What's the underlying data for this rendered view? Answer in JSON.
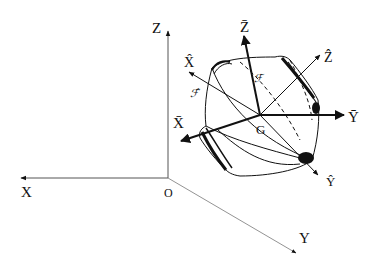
{
  "diagram": {
    "type": "3D coordinate frames with rigid body",
    "colors": {
      "ink": "#111111",
      "thin_axis": "#555555",
      "background": "#ffffff"
    },
    "fixed_frame": {
      "origin_label": "O",
      "x_label": "X",
      "y_label": "Y",
      "z_label": "Z"
    },
    "body_frame": {
      "center_label": "G",
      "x_label": "X̄",
      "y_label": "Ȳ",
      "z_label": "Z̄"
    },
    "hat_frame": {
      "x_label": "X̂",
      "y_label": "Ŷ",
      "z_label": "Ẑ"
    },
    "surface_labels": {
      "F": "ℱ",
      "F_hat": "ℱ̂"
    }
  }
}
